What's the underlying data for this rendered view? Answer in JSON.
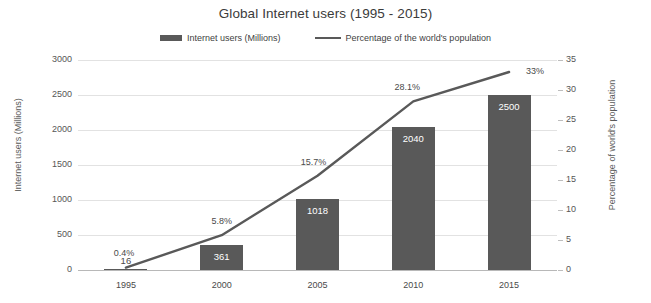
{
  "chart_data": {
    "type": "bar",
    "title": "Global Internet users (1995 - 2015)",
    "categories": [
      "1995",
      "2000",
      "2005",
      "2010",
      "2015"
    ],
    "xlabel": "",
    "ylabel": "Internet users (Millions)",
    "y2label": "Percentage of world's population",
    "ylim": [
      0,
      3000
    ],
    "y2lim": [
      0,
      35
    ],
    "yticks": [
      0,
      500,
      1000,
      1500,
      2000,
      2500,
      3000
    ],
    "y2ticks": [
      0,
      5,
      10,
      15,
      20,
      25,
      30,
      35
    ],
    "grid": true,
    "legend_position": "top-center",
    "series": [
      {
        "name": "Internet users (Millions)",
        "type": "bar",
        "axis": "left",
        "color": "#595959",
        "values": [
          16,
          361,
          1018,
          2040,
          2500
        ],
        "labels": [
          "16",
          "361",
          "1018",
          "2040",
          "2500"
        ]
      },
      {
        "name": "Percentage of the world's population",
        "type": "line",
        "axis": "right",
        "color": "#595959",
        "values": [
          0.4,
          5.8,
          15.7,
          28.1,
          33
        ],
        "labels": [
          "0.4%",
          "5.8%",
          "15.7%",
          "28.1%",
          "33%"
        ]
      }
    ]
  },
  "legend": {
    "bar_entry": "Internet users (Millions)",
    "line_entry": "Percentage of the world's population"
  },
  "axes": {
    "left_title": "Internet users (Millions)",
    "right_title": "Percentage of world's population",
    "left_ticks": [
      "3000",
      "2500",
      "2000",
      "1500",
      "1000",
      "500",
      "0"
    ],
    "right_ticks": [
      "35",
      "30",
      "25",
      "20",
      "15",
      "10",
      "5",
      "0"
    ]
  },
  "colors": {
    "bar": "#595959",
    "line": "#595959",
    "grid": "#e2e2e2",
    "text": "#4a4a4a",
    "background": "#ffffff"
  }
}
